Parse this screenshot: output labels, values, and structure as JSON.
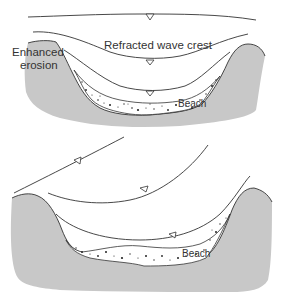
{
  "diagram": {
    "panels": [
      {
        "id": "top",
        "labels": {
          "wave_crest": "Refracted wave crest",
          "erosion_line1": "Enhanced",
          "erosion_line2": "erosion",
          "beach": "Beach"
        }
      },
      {
        "id": "bottom",
        "labels": {
          "beach": "Beach"
        }
      }
    ],
    "colors": {
      "land": "#c8c8c8",
      "line": "#333333",
      "sand": "#ffffff"
    }
  }
}
